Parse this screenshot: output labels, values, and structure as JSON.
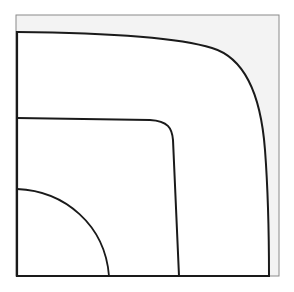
{
  "diagram": {
    "type": "nested-contour-curves",
    "frame": {
      "x": 16,
      "y": 15,
      "width": 263,
      "height": 261,
      "fill": "#f3f3f3",
      "stroke": "#8a8a8a"
    },
    "region_fill": "#ffffff",
    "axes_stroke": "#1a1a1a",
    "curves": [
      {
        "name": "outer-curve",
        "stroke": "#1a1a1a",
        "d": "M17,32 C110,33 180,38 212,48 C252,60 262,110 265,150 C268,190 269,240 269,276"
      },
      {
        "name": "middle-curve",
        "stroke": "#1a1a1a",
        "d": "M17,118 L150,120 C168,121 172,128 173,140 L179,276"
      },
      {
        "name": "inner-curve",
        "stroke": "#1a1a1a",
        "d": "M17,189 C65,191 105,225 109,276"
      }
    ]
  }
}
